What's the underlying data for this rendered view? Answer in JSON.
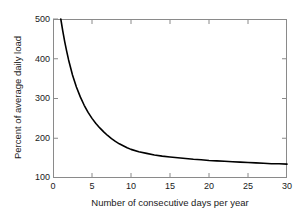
{
  "chart_data": {
    "type": "line",
    "title": "",
    "subtitle": "",
    "xlabel": "Number of consecutive days per year",
    "ylabel": "Percent of average daily load",
    "xlim": [
      0,
      30
    ],
    "ylim": [
      100,
      500
    ],
    "xticks": [
      0,
      5,
      10,
      15,
      20,
      25,
      30
    ],
    "yticks": [
      100,
      200,
      300,
      400,
      500
    ],
    "xtick_labels": [
      "0",
      "5",
      "10",
      "15",
      "20",
      "25",
      "30"
    ],
    "ytick_labels": [
      "100",
      "200",
      "300",
      "400",
      "500"
    ],
    "grid": false,
    "legend": null,
    "legend_position": "none",
    "annotations": [],
    "series": [
      {
        "name": "Percent of average daily load",
        "color": "#000000",
        "line_width": 1.6,
        "x": [
          1.0,
          1.25,
          1.5,
          1.75,
          2.0,
          2.5,
          3.0,
          3.5,
          4.0,
          4.5,
          5.0,
          5.5,
          6.0,
          6.5,
          7.0,
          7.5,
          8.0,
          8.5,
          9.0,
          9.5,
          10.0,
          11.0,
          12.0,
          13.0,
          14.0,
          15.0,
          16.0,
          17.0,
          18.0,
          19.0,
          20.0,
          21.0,
          22.0,
          23.0,
          24.0,
          25.0,
          26.0,
          27.0,
          28.0,
          29.0,
          30.0
        ],
        "y": [
          500,
          470,
          443,
          419,
          397,
          359,
          329,
          304,
          283,
          265,
          250,
          237,
          226,
          216,
          207,
          199,
          192,
          186,
          181,
          176,
          172,
          166,
          162,
          158,
          155,
          153,
          151,
          149,
          147,
          146,
          144,
          143,
          142,
          141,
          140,
          139,
          138,
          137,
          136,
          136,
          135
        ]
      }
    ]
  },
  "axes": {
    "ylabel_text": "Percent of average daily load",
    "xlabel_text": "Number of consecutive days per year"
  }
}
